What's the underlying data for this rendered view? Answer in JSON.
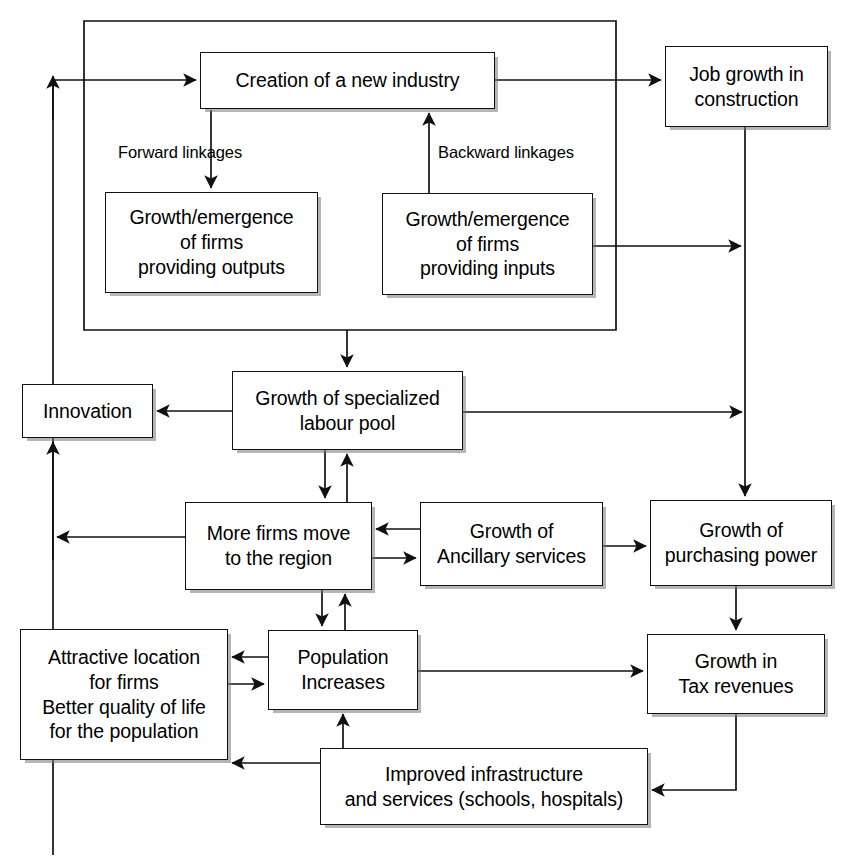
{
  "diagram": {
    "type": "flowchart",
    "background_color": "#ffffff",
    "line_color": "#111111",
    "box_fill": "#ffffff",
    "nodes": [
      {
        "id": "creation",
        "label": "Creation of a new industry",
        "x": 200,
        "y": 52,
        "w": 295,
        "h": 57
      },
      {
        "id": "job_growth",
        "label": "Job growth in\nconstruction",
        "x": 665,
        "y": 46,
        "w": 163,
        "h": 81
      },
      {
        "id": "firms_outputs",
        "label": "Growth/emergence\nof firms\nproviding outputs",
        "x": 105,
        "y": 192,
        "w": 213,
        "h": 101
      },
      {
        "id": "firms_inputs",
        "label": "Growth/emergence\nof firms\nproviding inputs",
        "x": 382,
        "y": 193,
        "w": 211,
        "h": 102
      },
      {
        "id": "labour_pool",
        "label": "Growth of specialized\nlabour pool",
        "x": 232,
        "y": 371,
        "w": 231,
        "h": 79
      },
      {
        "id": "innovation",
        "label": "Innovation",
        "x": 22,
        "y": 384,
        "w": 131,
        "h": 54
      },
      {
        "id": "more_firms",
        "label": "More firms move\nto the region",
        "x": 185,
        "y": 502,
        "w": 187,
        "h": 88
      },
      {
        "id": "ancillary",
        "label": "Growth of\nAncillary services",
        "x": 420,
        "y": 502,
        "w": 183,
        "h": 84
      },
      {
        "id": "purchasing",
        "label": "Growth of\npurchasing power",
        "x": 650,
        "y": 500,
        "w": 182,
        "h": 86
      },
      {
        "id": "attractive",
        "label": "Attractive location\nfor firms\nBetter quality of life\nfor the population",
        "x": 20,
        "y": 629,
        "w": 208,
        "h": 131
      },
      {
        "id": "population",
        "label": "Population\nIncreases",
        "x": 268,
        "y": 630,
        "w": 150,
        "h": 80
      },
      {
        "id": "tax_revenues",
        "label": "Growth in\nTax revenues",
        "x": 647,
        "y": 634,
        "w": 178,
        "h": 80
      },
      {
        "id": "infrastructure",
        "label": "Improved infrastructure\nand services (schools, hospitals)",
        "x": 320,
        "y": 748,
        "w": 328,
        "h": 77
      }
    ],
    "edge_labels": [
      {
        "id": "forward-linkages",
        "text": "Forward linkages",
        "x": 118,
        "y": 143
      },
      {
        "id": "backward-linkages",
        "text": "Backward linkages",
        "x": 438,
        "y": 143
      }
    ],
    "connections": [
      {
        "from": "feedback-loop-left",
        "to": "creation",
        "kind": "arrow"
      },
      {
        "from": "creation",
        "to": "job_growth",
        "kind": "arrow"
      },
      {
        "from": "creation",
        "to": "firms_outputs",
        "kind": "arrow",
        "label": "Forward linkages"
      },
      {
        "from": "firms_inputs",
        "to": "creation",
        "kind": "arrow",
        "label": "Backward linkages"
      },
      {
        "from": "firms_inputs",
        "to": "job-growth-line",
        "kind": "arrow"
      },
      {
        "from": "outer-loop",
        "to": "labour_pool",
        "kind": "arrow"
      },
      {
        "from": "labour_pool",
        "to": "innovation",
        "kind": "arrow"
      },
      {
        "from": "labour_pool",
        "to": "purchasing",
        "kind": "arrow"
      },
      {
        "from": "labour_pool",
        "to": "more_firms",
        "kind": "arrow"
      },
      {
        "from": "more_firms",
        "to": "labour_pool",
        "kind": "arrow"
      },
      {
        "from": "more_firms",
        "to": "innovation-line",
        "kind": "arrow"
      },
      {
        "from": "more_firms",
        "to": "ancillary",
        "kind": "arrow"
      },
      {
        "from": "ancillary",
        "to": "more_firms",
        "kind": "arrow"
      },
      {
        "from": "ancillary",
        "to": "purchasing",
        "kind": "arrow"
      },
      {
        "from": "more_firms",
        "to": "population",
        "kind": "arrow"
      },
      {
        "from": "population",
        "to": "more_firms",
        "kind": "arrow"
      },
      {
        "from": "population",
        "to": "attractive",
        "kind": "arrow"
      },
      {
        "from": "attractive",
        "to": "population",
        "kind": "arrow"
      },
      {
        "from": "population",
        "to": "tax_revenues",
        "kind": "arrow"
      },
      {
        "from": "tax_revenues",
        "to": "infrastructure",
        "kind": "arrow"
      },
      {
        "from": "infrastructure",
        "to": "population",
        "kind": "arrow"
      },
      {
        "from": "infrastructure",
        "to": "attractive",
        "kind": "arrow"
      },
      {
        "from": "purchasing",
        "to": "tax_revenues",
        "kind": "arrow"
      },
      {
        "from": "job_growth",
        "to": "purchasing",
        "kind": "arrow"
      }
    ]
  }
}
